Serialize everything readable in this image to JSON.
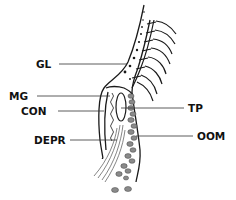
{
  "diagram": {
    "type": "anatomical-cross-section",
    "labels": {
      "gl": "GL",
      "mg": "MG",
      "con": "CON",
      "depr": "DEPR",
      "tp": "TP",
      "oom": "OOM"
    },
    "colors": {
      "line": "#1a1a1a",
      "fill_gray": "#8a8a8a",
      "leader": "#333333",
      "background": "#ffffff"
    }
  }
}
